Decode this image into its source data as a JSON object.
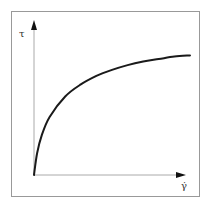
{
  "diagram": {
    "title": "",
    "y_axis_label": "τ",
    "x_axis_label": "γ̇",
    "curve_description": "shear-thinning flow curve (shear stress vs. shear rate)",
    "colors": {
      "frame": "#999999",
      "axes": "#aaaaaa",
      "curve": "#1a1a1a",
      "arrow": "#111111",
      "text": "#333333"
    }
  },
  "chart_data": {
    "type": "line",
    "title": "",
    "xlabel": "γ̇",
    "ylabel": "τ",
    "grid": false,
    "legend": null,
    "x": [
      0,
      0.02,
      0.05,
      0.1,
      0.2,
      0.3,
      0.4,
      0.5,
      0.6,
      0.7,
      0.8,
      0.9,
      1.0
    ],
    "series": [
      {
        "name": "τ(γ̇)",
        "values": [
          0,
          0.18,
          0.33,
          0.48,
          0.65,
          0.75,
          0.82,
          0.87,
          0.91,
          0.94,
          0.96,
          0.98,
          0.99
        ]
      }
    ],
    "xlim": [
      0,
      1
    ],
    "ylim": [
      0,
      1.25
    ]
  }
}
